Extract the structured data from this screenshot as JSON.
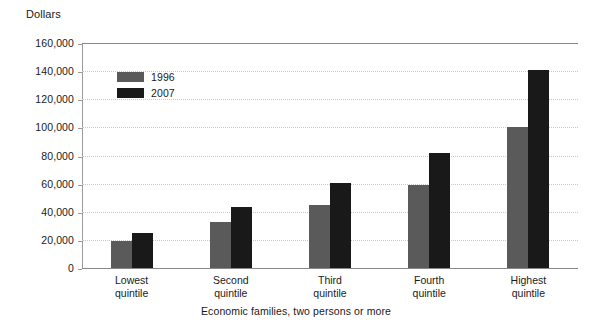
{
  "chart_data": {
    "type": "bar",
    "title": "",
    "subtitle": "",
    "xlabel": "Economic families, two persons or more",
    "ylabel": "Dollars",
    "categories": [
      "Lowest\nquintile",
      "Second\nquintile",
      "Third\nquintile",
      "Fourth\nquintile",
      "Highest\nquintile"
    ],
    "series": [
      {
        "name": "1996",
        "color": "#5a5a5a",
        "values": [
          19000,
          33000,
          45000,
          59000,
          100000
        ]
      },
      {
        "name": "2007",
        "color": "#191919",
        "values": [
          25000,
          43500,
          60500,
          82000,
          140500
        ]
      }
    ],
    "ylim": [
      0,
      160000
    ],
    "ytick_values": [
      0,
      20000,
      40000,
      60000,
      80000,
      100000,
      120000,
      140000,
      160000
    ],
    "ytick_labels": [
      "0",
      "20,000",
      "40,000",
      "60,000",
      "80,000",
      "100,000",
      "120,000",
      "140,000",
      "160,000"
    ],
    "grid": "horizontal-dotted",
    "legend_position": "inside-top-left",
    "bar_order": "grouped-adjacent"
  },
  "axes": {
    "y_title": "Dollars",
    "x_title": "Economic families, two persons or more"
  },
  "legend": {
    "entries": [
      {
        "label": "1996",
        "color": "#5a5a5a"
      },
      {
        "label": "2007",
        "color": "#191919"
      }
    ]
  },
  "colors": {
    "series_1996": "#5a5a5a",
    "series_2007": "#191919",
    "gridline": "#c8c8c8",
    "axis": "#8a8a8a",
    "background": "#ffffff",
    "text": "#1a1a1a"
  }
}
